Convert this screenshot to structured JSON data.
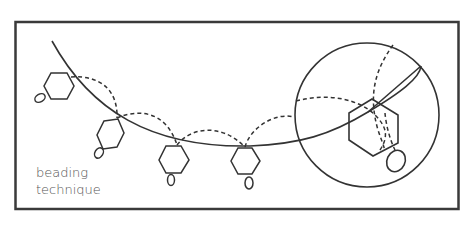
{
  "diagram": {
    "caption_lines": [
      "beading",
      "technique"
    ],
    "colors": {
      "stroke": "#333333",
      "frame": "#3a3a3a",
      "text": "#555555",
      "background": "#ffffff"
    },
    "elements": {
      "frame": "rectangular-border",
      "thread": "curved-thread-line",
      "beads": [
        {
          "id": 1,
          "shape": "hexagon",
          "with_loop": true
        },
        {
          "id": 2,
          "shape": "hexagon",
          "with_loop": true
        },
        {
          "id": 3,
          "shape": "hexagon",
          "with_loop": true
        },
        {
          "id": 4,
          "shape": "hexagon",
          "with_loop": true
        },
        {
          "id": 5,
          "shape": "hexagon",
          "with_loop": true,
          "magnified": true
        }
      ],
      "stitches": "dashed-arcs-between-beads",
      "magnifier": "circle-detail-view"
    }
  }
}
